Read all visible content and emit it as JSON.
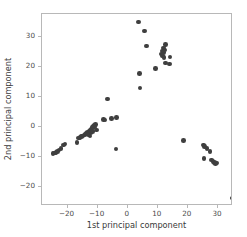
{
  "chart_data": {
    "type": "scatter",
    "title": "",
    "xlabel": "1st principal component",
    "ylabel": "2nd principal component",
    "xlim": [
      -28.5,
      35.0
    ],
    "ylim": [
      -26.5,
      37.5
    ],
    "xticks": [
      -20,
      -10,
      0,
      10,
      20,
      30
    ],
    "xticklabels": [
      "−20",
      "−10",
      "0",
      "10",
      "20",
      "30"
    ],
    "yticks": [
      30,
      20,
      10,
      0,
      -10,
      -20
    ],
    "yticklabels": [
      "30",
      "20",
      "10",
      "0",
      "−10",
      "−20"
    ],
    "grid": false,
    "legend": null,
    "marker_color": "#3f3f3f",
    "marker_size": 4.6,
    "series": [
      {
        "name": "samples",
        "points": [
          [
            3.6,
            34.9
          ],
          [
            5.6,
            31.8
          ],
          [
            6.2,
            26.9
          ],
          [
            12.6,
            27.3
          ],
          [
            11.8,
            26.1
          ],
          [
            12.2,
            25.5
          ],
          [
            11.4,
            25.2
          ],
          [
            11.9,
            24.6
          ],
          [
            11.2,
            24.1
          ],
          [
            11.6,
            23.5
          ],
          [
            12.1,
            23.0
          ],
          [
            14.0,
            23.2
          ],
          [
            3.9,
            17.6
          ],
          [
            9.2,
            19.3
          ],
          [
            12.6,
            21.1
          ],
          [
            13.9,
            20.9
          ],
          [
            4.1,
            12.8
          ],
          [
            -6.8,
            9.1
          ],
          [
            -8.1,
            2.4
          ],
          [
            -7.6,
            2.1
          ],
          [
            -5.3,
            2.6
          ],
          [
            -3.8,
            3.0
          ],
          [
            -10.7,
            0.6
          ],
          [
            -11.2,
            0.3
          ],
          [
            -11.0,
            -0.2
          ],
          [
            -11.6,
            0.1
          ],
          [
            -11.9,
            -0.4
          ],
          [
            -12.1,
            -0.9
          ],
          [
            -12.5,
            -1.3
          ],
          [
            -12.9,
            -1.7
          ],
          [
            -13.3,
            -2.0
          ],
          [
            -13.8,
            -2.3
          ],
          [
            -14.2,
            -2.6
          ],
          [
            -14.6,
            -2.9
          ],
          [
            -15.0,
            -3.2
          ],
          [
            -15.4,
            -3.4
          ],
          [
            -15.9,
            -3.6
          ],
          [
            -16.3,
            -3.9
          ],
          [
            -16.9,
            -5.3
          ],
          [
            -12.6,
            -3.1
          ],
          [
            -13.1,
            -2.7
          ],
          [
            -12.2,
            -2.2
          ],
          [
            -11.8,
            -1.6
          ],
          [
            -10.4,
            -1.1
          ],
          [
            -20.9,
            -5.9
          ],
          [
            -21.4,
            -6.2
          ],
          [
            -22.2,
            -7.3
          ],
          [
            -22.8,
            -7.9
          ],
          [
            -23.4,
            -8.3
          ],
          [
            -23.9,
            -8.6
          ],
          [
            -24.4,
            -8.8
          ],
          [
            -24.9,
            -9.0
          ],
          [
            -3.9,
            -7.5
          ],
          [
            18.6,
            -4.6
          ],
          [
            25.1,
            -6.1
          ],
          [
            25.6,
            -6.6
          ],
          [
            26.3,
            -7.3
          ],
          [
            27.4,
            -8.3
          ],
          [
            25.4,
            -10.6
          ],
          [
            27.8,
            -11.1
          ],
          [
            28.3,
            -11.6
          ],
          [
            28.8,
            -12.0
          ],
          [
            29.2,
            -12.4
          ],
          [
            29.6,
            -12.2
          ],
          [
            34.8,
            -23.9
          ]
        ]
      }
    ]
  }
}
